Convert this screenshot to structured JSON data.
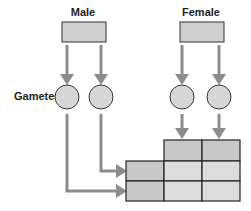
{
  "diagram": {
    "labels": {
      "male": "Male",
      "female": "Female",
      "gametes": "Gametes"
    },
    "colors": {
      "box_fill": "#cfcfcf",
      "box_stroke": "#333333",
      "circle_fill": "#d6d6d6",
      "arrow": "#8c8c8c",
      "grid_header": "#c8c8c8",
      "grid_cell": "#dcdcdc",
      "grid_line": "#222222"
    },
    "parents": [
      "Male",
      "Female"
    ],
    "gametes_per_parent": 2,
    "punnett_grid": {
      "rows": 2,
      "cols": 2
    }
  }
}
